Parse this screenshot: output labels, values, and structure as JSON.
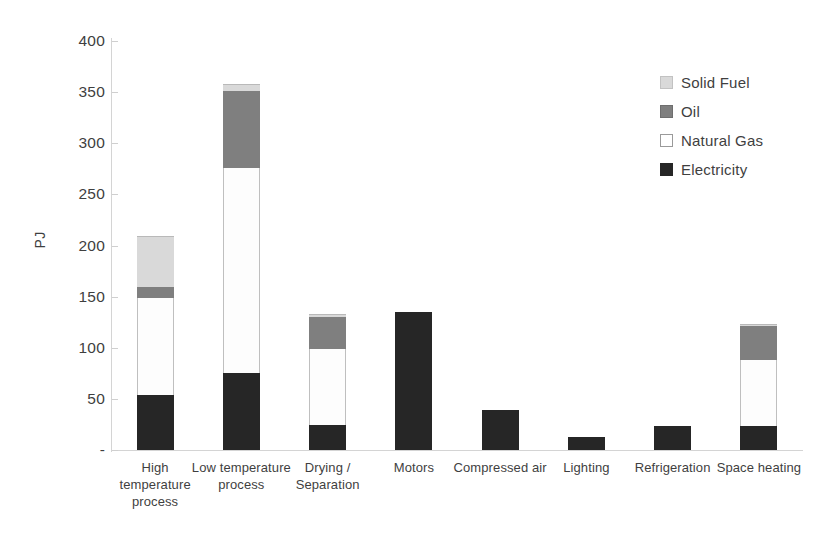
{
  "chart_data": {
    "type": "bar",
    "stacked": true,
    "title": "",
    "xlabel": "",
    "ylabel": "PJ",
    "ylim": [
      0,
      400
    ],
    "ytick_step": 50,
    "ytick_labels": [
      "400",
      "350",
      "300",
      "250",
      "200",
      "150",
      "100",
      "50",
      "-"
    ],
    "ytick_values": [
      400,
      350,
      300,
      250,
      200,
      150,
      100,
      50,
      0
    ],
    "grid": false,
    "legend_position": "top-right",
    "categories": [
      "High temperature process",
      "Low temperature process",
      "Drying / Separation",
      "Motors",
      "Compressed air",
      "Lighting",
      "Refrigeration",
      "Space heating"
    ],
    "series": [
      {
        "name": "Electricity",
        "color": "#262626",
        "values": [
          54,
          75,
          24,
          135,
          39,
          13,
          23,
          23
        ]
      },
      {
        "name": "Natural Gas",
        "color": "#ffffff",
        "values": [
          95,
          201,
          75,
          0,
          0,
          0,
          0,
          65
        ]
      },
      {
        "name": "Oil",
        "color": "#7f7f7f",
        "values": [
          10,
          75,
          31,
          0,
          0,
          0,
          0,
          33
        ]
      },
      {
        "name": "Solid Fuel",
        "color": "#d9d9d9",
        "values": [
          50,
          7,
          3,
          0,
          0,
          0,
          0,
          2
        ]
      }
    ],
    "totals": [
      209,
      358,
      133,
      135,
      39,
      13,
      23,
      123
    ]
  },
  "legend": {
    "items": [
      {
        "label": "Solid Fuel",
        "swatch": "solid"
      },
      {
        "label": "Oil",
        "swatch": "oil"
      },
      {
        "label": "Natural Gas",
        "swatch": "gas"
      },
      {
        "label": "Electricity",
        "swatch": "elec"
      }
    ]
  }
}
